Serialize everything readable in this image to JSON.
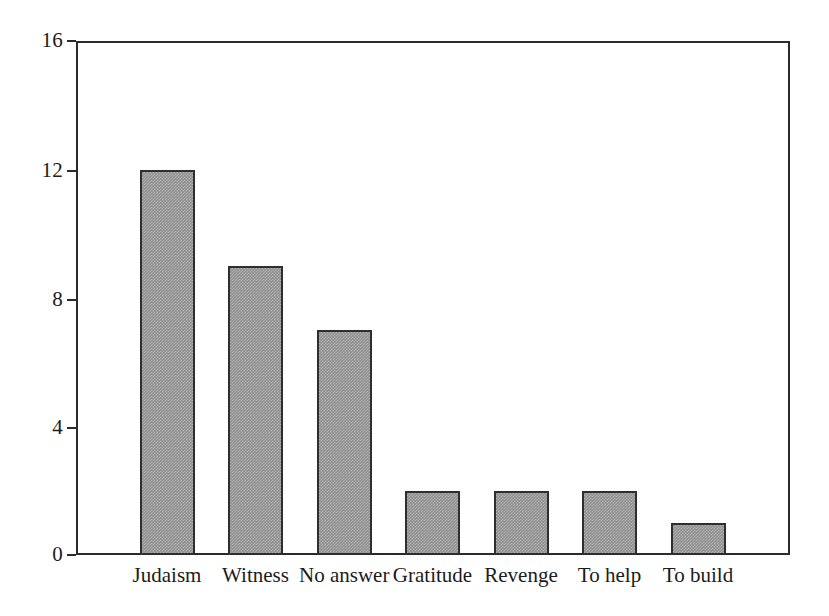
{
  "chart_data": {
    "type": "bar",
    "title": "",
    "subtitle": "",
    "xlabel": "",
    "ylabel": "",
    "categories": [
      "Judaism",
      "Witness",
      "No answer",
      "Gratitude",
      "Revenge",
      "To help",
      "To build"
    ],
    "values": [
      12,
      9,
      7,
      2,
      2,
      2,
      1
    ],
    "ylim": [
      0,
      16
    ],
    "yticks": [
      0,
      4,
      8,
      12,
      16
    ],
    "ytick_labels": [
      "0",
      "4",
      "8",
      "12",
      "16"
    ],
    "grid": false,
    "legend": null,
    "bar_fill_color": "#8f8f8f",
    "bar_edge_color": "#2e2e2e",
    "axis_color": "#2b2b2b",
    "background_color": "#ffffff"
  },
  "axes": {
    "y_ticks": [
      {
        "label": "16",
        "value": 16
      },
      {
        "label": "12",
        "value": 12
      },
      {
        "label": "8",
        "value": 8
      },
      {
        "label": "4",
        "value": 4
      },
      {
        "label": "0",
        "value": 0
      }
    ],
    "x_ticks": [
      {
        "label": "Judaism"
      },
      {
        "label": "Witness"
      },
      {
        "label": "No answer"
      },
      {
        "label": "Gratitude"
      },
      {
        "label": "Revenge"
      },
      {
        "label": "To help"
      },
      {
        "label": "To build"
      }
    ]
  },
  "bars": [
    {
      "label": "Judaism",
      "value": 12
    },
    {
      "label": "Witness",
      "value": 9
    },
    {
      "label": "No answer",
      "value": 7
    },
    {
      "label": "Gratitude",
      "value": 2
    },
    {
      "label": "Revenge",
      "value": 2
    },
    {
      "label": "To help",
      "value": 2
    },
    {
      "label": "To build",
      "value": 1
    }
  ]
}
